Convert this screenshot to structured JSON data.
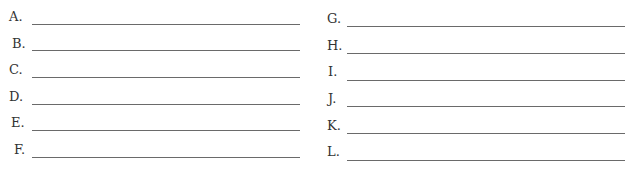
{
  "worksheet": {
    "left_column": [
      {
        "label": "A.",
        "value": ""
      },
      {
        "label": "B.",
        "value": ""
      },
      {
        "label": "C.",
        "value": ""
      },
      {
        "label": "D.",
        "value": ""
      },
      {
        "label": "E.",
        "value": ""
      },
      {
        "label": "F.",
        "value": ""
      }
    ],
    "right_column": [
      {
        "label": "G.",
        "value": ""
      },
      {
        "label": "H.",
        "value": ""
      },
      {
        "label": "I.",
        "value": ""
      },
      {
        "label": "J.",
        "value": ""
      },
      {
        "label": "K.",
        "value": ""
      },
      {
        "label": "L.",
        "value": ""
      }
    ]
  }
}
